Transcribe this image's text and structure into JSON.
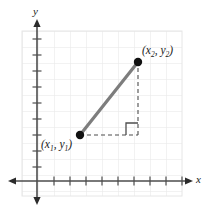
{
  "figure": {
    "kind": "coordinate-plane-diagram",
    "width": 209,
    "height": 213,
    "background_color": "#ffffff"
  },
  "axes": {
    "x_axis_label": "x",
    "y_axis_label": "y",
    "axis_color": "#4d4d4d",
    "x_axis_y_px": 181,
    "y_axis_x_px": 37,
    "x_axis_start_px": 8,
    "x_axis_end_px": 193,
    "y_axis_start_px": 19,
    "y_axis_end_px": 205,
    "tick_spacing_px": 16,
    "tick_length_px": 5,
    "x_ticks_px": [
      54,
      70,
      86,
      102,
      118,
      134,
      150,
      166,
      182
    ],
    "y_ticks_px": [
      39,
      55,
      71,
      87,
      103,
      119,
      135,
      151,
      167
    ],
    "arrowheads": [
      "left",
      "right",
      "up",
      "down"
    ]
  },
  "grid": {
    "color": "#e6e6e6",
    "spacing_px": 16,
    "left_px": 22,
    "top_px": 31,
    "right_px": 182,
    "bottom_px": 196,
    "visible": true
  },
  "points": [
    {
      "id": "p1",
      "label_plain": "(x1, y1)",
      "label_var": "x",
      "label_sub_1": "1",
      "label_var_2": "y",
      "label_sub_2": "1",
      "x_px": 80,
      "y_px": 135,
      "marker_color": "#111111",
      "marker_radius_px": 4.2
    },
    {
      "id": "p2",
      "label_plain": "(x2, y2)",
      "label_var": "x",
      "label_sub_1": "2",
      "label_var_2": "y",
      "label_sub_2": "2",
      "x_px": 138,
      "y_px": 62,
      "marker_color": "#111111",
      "marker_radius_px": 4.2
    }
  ],
  "hypotenuse": {
    "color": "#7d7d7d",
    "width_px": 3.2,
    "x1_px": 80,
    "y1_px": 135,
    "x2_px": 138,
    "y2_px": 62
  },
  "legs": {
    "color": "#4d4d4d",
    "width_px": 1.1,
    "dash_pattern": "4,3",
    "horizontal": {
      "x1_px": 80,
      "y1_px": 135,
      "x2_px": 138,
      "y2_px": 135
    },
    "vertical": {
      "x1_px": 138,
      "y1_px": 135,
      "x2_px": 138,
      "y2_px": 62
    }
  },
  "right_angle_marker": {
    "color": "#4d4d4d",
    "width_px": 1.3,
    "size_px": 12,
    "corner_x_px": 138,
    "corner_y_px": 135
  },
  "labels": {
    "p2_open": "(",
    "p2_comma": ", ",
    "p2_close": ")",
    "p1_open": "(",
    "p1_comma": ", ",
    "p1_close": ")"
  }
}
